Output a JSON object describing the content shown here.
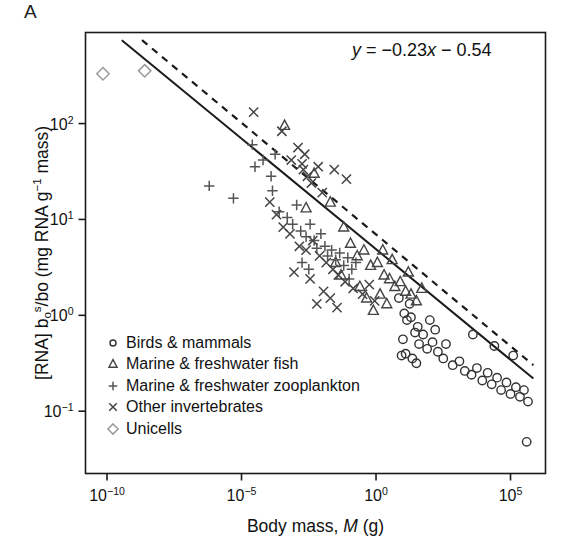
{
  "panel": {
    "label": "A"
  },
  "annotation": {
    "equation_prefix": "y",
    "equation_body": " = −0.23",
    "equation_x": "x",
    "equation_suffix": " − 0.54"
  },
  "axes": {
    "x": {
      "title_text": "Body mass, ",
      "title_italic": "M",
      "title_unit": " (g)",
      "ticks": [
        "10−10",
        "10−5",
        "100",
        "105"
      ],
      "tick_bases": [
        "10",
        "10",
        "10",
        "10"
      ],
      "tick_exponents": [
        "−10",
        "−5",
        "0",
        "5"
      ],
      "exponent_values": [
        -10,
        -5,
        0,
        5
      ],
      "range": [
        -10.8,
        6.3
      ]
    },
    "y": {
      "title": "[RNA] b₀ˢ/bo (mg RNA g⁻¹ mass)",
      "ticks": [
        "102",
        "101",
        "100",
        "10−1"
      ],
      "tick_bases": [
        "10",
        "10",
        "10",
        "10"
      ],
      "tick_exponents": [
        "2",
        "1",
        "0",
        "−1"
      ],
      "exponent_values": [
        2,
        1,
        0,
        -1
      ],
      "range": [
        -1.65,
        2.95
      ]
    }
  },
  "legend": {
    "items": [
      {
        "symbol": "circle",
        "label": "Birds & mammals",
        "color": "#333333"
      },
      {
        "symbol": "triangle",
        "label": "Marine & freshwater fish",
        "color": "#444444"
      },
      {
        "symbol": "plus",
        "label": "Marine & freshwater zooplankton",
        "color": "#555555"
      },
      {
        "symbol": "cross",
        "label": "Other invertebrates",
        "color": "#444444"
      },
      {
        "symbol": "diamond",
        "label": "Unicells",
        "color": "#9a9a9a"
      }
    ]
  },
  "chart_data": {
    "type": "scatter",
    "title": "",
    "xlabel": "Body mass, M (g)",
    "ylabel": "[RNA] b₀ˢ/bo (mg RNA g⁻¹ mass)",
    "x_scale": "log10",
    "y_scale": "log10",
    "xlim": [
      -10.8,
      6.3
    ],
    "ylim": [
      -1.65,
      2.95
    ],
    "grid": false,
    "legend_position": "bottom-left",
    "annotations": [
      {
        "text": "y = −0.23x − 0.54",
        "x": 2.1,
        "y": 2.62
      },
      {
        "text": "A",
        "x": -11.6,
        "y": 3.25
      }
    ],
    "fits": [
      {
        "name": "fitted regression",
        "style": "solid",
        "slope": -0.23,
        "intercept": -0.54,
        "x_start": -9.45,
        "x_end": 5.85,
        "y_start": 2.87,
        "y_end": -0.66,
        "color": "#1a1a1a"
      },
      {
        "name": "predicted slope",
        "style": "dashed",
        "x_start": -8.7,
        "x_end": 5.85,
        "y_start": 2.87,
        "y_end": -0.52,
        "color": "#1a1a1a"
      }
    ],
    "series": [
      {
        "name": "Birds & mammals",
        "marker": "circle",
        "color": "#333333",
        "points": [
          [
            0.85,
            0.18
          ],
          [
            1.05,
            0.02
          ],
          [
            1.15,
            -0.05
          ],
          [
            1.25,
            0.12
          ],
          [
            1.3,
            -0.02
          ],
          [
            1.45,
            -0.18
          ],
          [
            1.55,
            -0.12
          ],
          [
            1.6,
            -0.3
          ],
          [
            1.75,
            -0.2
          ],
          [
            1.9,
            -0.35
          ],
          [
            1.0,
            -0.25
          ],
          [
            1.1,
            -0.4
          ],
          [
            0.95,
            -0.42
          ],
          [
            1.35,
            -0.45
          ],
          [
            1.5,
            -0.5
          ],
          [
            2.1,
            -0.28
          ],
          [
            2.3,
            -0.38
          ],
          [
            2.5,
            -0.45
          ],
          [
            2.6,
            -0.3
          ],
          [
            2.85,
            -0.52
          ],
          [
            3.1,
            -0.48
          ],
          [
            3.3,
            -0.58
          ],
          [
            3.55,
            -0.62
          ],
          [
            3.75,
            -0.55
          ],
          [
            3.95,
            -0.68
          ],
          [
            4.15,
            -0.6
          ],
          [
            4.3,
            -0.72
          ],
          [
            4.5,
            -0.65
          ],
          [
            4.65,
            -0.78
          ],
          [
            4.85,
            -0.7
          ],
          [
            5.0,
            -0.82
          ],
          [
            5.2,
            -0.75
          ],
          [
            5.35,
            -0.85
          ],
          [
            5.5,
            -0.78
          ],
          [
            5.65,
            -0.9
          ],
          [
            3.6,
            -0.2
          ],
          [
            4.4,
            -0.32
          ],
          [
            5.1,
            -0.42
          ],
          [
            2.0,
            -0.05
          ],
          [
            2.2,
            -0.15
          ],
          [
            5.6,
            -1.32
          ]
        ]
      },
      {
        "name": "Marine & freshwater fish",
        "marker": "triangle",
        "color": "#444444",
        "points": [
          [
            -3.4,
            1.98
          ],
          [
            -2.3,
            1.48
          ],
          [
            -2.6,
            1.12
          ],
          [
            -1.7,
            1.18
          ],
          [
            -1.2,
            0.92
          ],
          [
            -0.95,
            0.75
          ],
          [
            -0.7,
            0.62
          ],
          [
            -0.45,
            0.68
          ],
          [
            -0.2,
            0.52
          ],
          [
            0.05,
            0.55
          ],
          [
            0.3,
            0.42
          ],
          [
            0.5,
            0.38
          ],
          [
            0.7,
            0.3
          ],
          [
            0.9,
            0.35
          ],
          [
            1.1,
            0.25
          ],
          [
            1.3,
            0.22
          ],
          [
            1.5,
            0.15
          ],
          [
            1.7,
            0.28
          ],
          [
            0.15,
            0.22
          ],
          [
            0.4,
            0.12
          ],
          [
            -0.6,
            0.3
          ],
          [
            -0.35,
            0.18
          ],
          [
            -0.1,
            0.05
          ],
          [
            0.6,
            0.58
          ],
          [
            1.2,
            0.45
          ],
          [
            0.25,
            0.68
          ],
          [
            -1.5,
            0.55
          ],
          [
            -1.3,
            0.42
          ]
        ]
      },
      {
        "name": "Marine & freshwater zooplankton",
        "marker": "plus",
        "color": "#555555",
        "points": [
          [
            -6.2,
            1.35
          ],
          [
            -5.3,
            1.22
          ],
          [
            -4.6,
            1.78
          ],
          [
            -4.5,
            1.55
          ],
          [
            -3.9,
            1.45
          ],
          [
            -3.85,
            1.3
          ],
          [
            -3.6,
            1.08
          ],
          [
            -3.3,
            1.02
          ],
          [
            -3.1,
            0.95
          ],
          [
            -2.95,
            1.15
          ],
          [
            -2.8,
            0.88
          ],
          [
            -2.6,
            0.82
          ],
          [
            -2.45,
            0.95
          ],
          [
            -2.3,
            0.78
          ],
          [
            -2.2,
            0.7
          ],
          [
            -2.05,
            0.85
          ],
          [
            -1.9,
            0.72
          ],
          [
            -1.8,
            0.62
          ],
          [
            -1.65,
            0.68
          ],
          [
            -1.5,
            0.58
          ],
          [
            -1.35,
            0.65
          ],
          [
            -1.2,
            0.52
          ],
          [
            -1.05,
            0.6
          ],
          [
            -0.9,
            0.48
          ],
          [
            -0.75,
            0.55
          ],
          [
            -2.75,
            0.55
          ],
          [
            -2.5,
            0.48
          ],
          [
            -4.2,
            1.62
          ],
          [
            -3.75,
            1.68
          ],
          [
            -1.0,
            0.38
          ]
        ]
      },
      {
        "name": "Other invertebrates",
        "marker": "cross",
        "color": "#444444",
        "points": [
          [
            -4.55,
            2.12
          ],
          [
            -3.5,
            1.92
          ],
          [
            -2.9,
            1.75
          ],
          [
            -3.15,
            1.62
          ],
          [
            -2.75,
            1.58
          ],
          [
            -2.7,
            1.52
          ],
          [
            -2.65,
            1.68
          ],
          [
            -2.55,
            1.45
          ],
          [
            -2.4,
            1.38
          ],
          [
            -2.15,
            1.55
          ],
          [
            -2.0,
            1.28
          ],
          [
            -1.55,
            1.52
          ],
          [
            -1.1,
            1.42
          ],
          [
            -3.95,
            1.18
          ],
          [
            -3.7,
            1.05
          ],
          [
            -3.45,
            0.92
          ],
          [
            -3.2,
            0.85
          ],
          [
            -2.85,
            0.72
          ],
          [
            -2.6,
            0.68
          ],
          [
            -2.35,
            0.78
          ],
          [
            -2.1,
            0.62
          ],
          [
            -1.85,
            0.55
          ],
          [
            -1.6,
            0.48
          ],
          [
            -1.4,
            0.42
          ],
          [
            -1.15,
            0.35
          ],
          [
            -0.85,
            0.28
          ],
          [
            -0.5,
            0.22
          ],
          [
            -0.25,
            0.32
          ],
          [
            -3.05,
            0.45
          ],
          [
            -2.45,
            0.38
          ],
          [
            -1.95,
            0.25
          ],
          [
            -1.7,
            0.18
          ],
          [
            -2.2,
            0.12
          ],
          [
            -1.45,
            0.08
          ],
          [
            -0.05,
            0.15
          ]
        ]
      },
      {
        "name": "Unicells",
        "marker": "diamond",
        "color": "#9a9a9a",
        "points": [
          [
            -10.15,
            2.52
          ],
          [
            -8.6,
            2.55
          ]
        ]
      }
    ]
  }
}
